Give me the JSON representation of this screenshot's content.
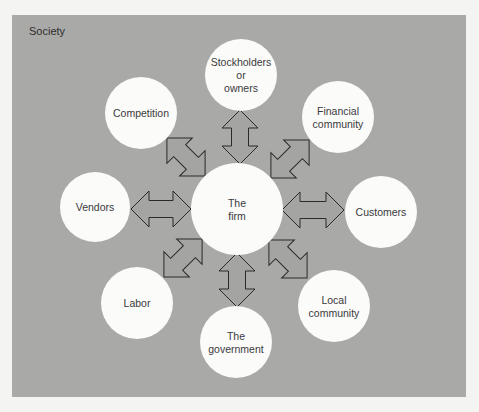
{
  "diagram": {
    "title": "Society",
    "colors": {
      "background": "#a9a9a7",
      "circle": "#fbfbfa",
      "text": "#3a3a3a",
      "arrow_stroke": "#2a2a2a"
    },
    "center": {
      "id": "the-firm",
      "lines": [
        "The",
        "firm"
      ],
      "cx": 237,
      "cy": 209,
      "r": 46
    },
    "nodes": [
      {
        "id": "stockholders",
        "lines": [
          "Stockholders",
          "or",
          "owners"
        ],
        "cx": 241,
        "cy": 75,
        "r": 36
      },
      {
        "id": "financial-community",
        "lines": [
          "Financial",
          "community"
        ],
        "cx": 338,
        "cy": 117,
        "r": 36
      },
      {
        "id": "customers",
        "lines": [
          "Customers"
        ],
        "cx": 381,
        "cy": 212,
        "r": 36
      },
      {
        "id": "local-community",
        "lines": [
          "Local",
          "community"
        ],
        "cx": 334,
        "cy": 306,
        "r": 36
      },
      {
        "id": "government",
        "lines": [
          "The",
          "government"
        ],
        "cx": 236,
        "cy": 342,
        "r": 36
      },
      {
        "id": "labor",
        "lines": [
          "Labor"
        ],
        "cx": 137,
        "cy": 303,
        "r": 36
      },
      {
        "id": "vendors",
        "lines": [
          "Vendors"
        ],
        "cx": 95,
        "cy": 207,
        "r": 35
      },
      {
        "id": "competition",
        "lines": [
          "Competition"
        ],
        "cx": 141,
        "cy": 113,
        "r": 36
      }
    ],
    "arrows": [
      {
        "id": "arrow-stockholders",
        "cx": 240,
        "cy": 137,
        "angle": 90,
        "length": 54
      },
      {
        "id": "arrow-financial",
        "cx": 290,
        "cy": 159,
        "angle": -45,
        "length": 54
      },
      {
        "id": "arrow-customers",
        "cx": 313,
        "cy": 210,
        "angle": 0,
        "length": 62
      },
      {
        "id": "arrow-local",
        "cx": 288,
        "cy": 259,
        "angle": 45,
        "length": 54
      },
      {
        "id": "arrow-government",
        "cx": 237,
        "cy": 280,
        "angle": 90,
        "length": 54
      },
      {
        "id": "arrow-labor",
        "cx": 183,
        "cy": 258,
        "angle": -45,
        "length": 54
      },
      {
        "id": "arrow-vendors",
        "cx": 161,
        "cy": 209,
        "angle": 0,
        "length": 60
      },
      {
        "id": "arrow-competition",
        "cx": 186,
        "cy": 157,
        "angle": 45,
        "length": 54
      }
    ],
    "arrow_shape": {
      "head_width": 36,
      "shaft_width": 17,
      "head_length": 18
    }
  }
}
